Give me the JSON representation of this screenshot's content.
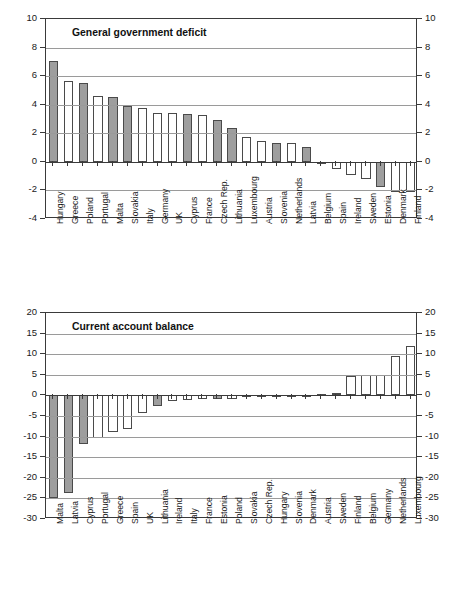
{
  "figure": {
    "background": "#ffffff",
    "axis_color": "#3a3a3a",
    "grid_color": "#9a9a9a",
    "shaded_bar_color": "#9e9e9e",
    "plain_bar_color": "#ffffff",
    "bar_border_color": "#4a4a4a"
  },
  "chart_data": [
    {
      "id": "general-government-deficit",
      "type": "bar",
      "title": "General government deficit",
      "xlabel": "",
      "ylabel": "",
      "ylim": [
        -4,
        10
      ],
      "yticks": [
        10,
        8,
        6,
        4,
        2,
        0,
        -2,
        -4
      ],
      "ytick_labels": [
        "10",
        "8",
        "6",
        "4",
        "2",
        "0",
        "-2",
        "-4"
      ],
      "grid": true,
      "legend": "none",
      "dual_axis": true,
      "categories": [
        "Hungary",
        "Greece",
        "Poland",
        "Portugal",
        "Malta",
        "Slovakia",
        "Italy",
        "Germany",
        "UK",
        "Cyprus",
        "France",
        "Czech Rep.",
        "Lithuania",
        "Luxembourg",
        "Austria",
        "Slovenia",
        "Netherlands",
        "Latvia",
        "Belgium",
        "Spain",
        "Ireland",
        "Sweden",
        "Estonia",
        "Denmark",
        "Finland"
      ],
      "values": [
        7.05,
        5.65,
        5.55,
        4.6,
        4.55,
        3.9,
        3.75,
        3.45,
        3.4,
        3.35,
        3.3,
        2.9,
        2.4,
        1.75,
        1.45,
        1.3,
        1.3,
        1.05,
        0.0,
        -0.5,
        -0.9,
        -1.2,
        -1.75,
        -2.1,
        -2.1
      ],
      "shaded": [
        true,
        false,
        true,
        false,
        true,
        true,
        false,
        false,
        false,
        true,
        false,
        true,
        true,
        false,
        false,
        true,
        false,
        true,
        false,
        false,
        false,
        false,
        true,
        false,
        false
      ]
    },
    {
      "id": "current-account-balance",
      "type": "bar",
      "title": "Current account balance",
      "xlabel": "",
      "ylabel": "",
      "ylim": [
        -30,
        20
      ],
      "yticks": [
        20,
        15,
        10,
        5,
        0,
        -5,
        -10,
        -15,
        -20,
        -25,
        -30
      ],
      "ytick_labels": [
        "20",
        "15",
        "10",
        "5",
        "0",
        "-5",
        "-10",
        "-15",
        "-20",
        "-25",
        "-30"
      ],
      "grid": true,
      "legend": "none",
      "dual_axis": true,
      "categories": [
        "Malta",
        "Latvia",
        "Cyprus",
        "Portugal",
        "Greece",
        "Spain",
        "UK",
        "Lithuania",
        "Ireland",
        "Italy",
        "France",
        "Estonia",
        "Poland",
        "Slovakia",
        "Czech Rep.",
        "Hungary",
        "Slovenia",
        "Denmark",
        "Austria",
        "Sweden",
        "Finland",
        "Belgium",
        "Germany",
        "Netherlands",
        "Luxembourg"
      ],
      "values": [
        -24.8,
        -23.6,
        -11.7,
        -10.3,
        -8.9,
        -8.2,
        -4.3,
        -2.5,
        -1.4,
        -1.2,
        -0.9,
        -0.9,
        -0.9,
        -0.5,
        -0.4,
        -0.3,
        -0.2,
        -0.1,
        0.3,
        0.7,
        4.7,
        5.0,
        5.0,
        9.5,
        11.9
      ],
      "shaded": [
        true,
        true,
        true,
        false,
        false,
        false,
        false,
        true,
        false,
        false,
        false,
        true,
        false,
        false,
        false,
        false,
        false,
        false,
        false,
        false,
        false,
        false,
        false,
        false,
        false
      ]
    }
  ]
}
